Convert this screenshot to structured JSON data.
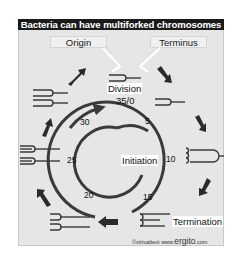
{
  "title": "Bacteria can have multiforked chromosomes",
  "callouts": {
    "origin": "Origin",
    "terminus": "Terminus"
  },
  "labels": {
    "division": "Division",
    "division_time": "35/0",
    "initiation": "Initiation",
    "termination": "Termination"
  },
  "cycle_times": {
    "inner": [
      "5",
      "10",
      "15",
      "20"
    ],
    "outer": [
      "25",
      "30"
    ]
  },
  "stages": [
    {
      "position": "top-center",
      "form": "single fork (replication initiated)"
    },
    {
      "position": "upper-right",
      "form": "single fork, extended"
    },
    {
      "position": "right",
      "form": "multiforked (secondary forks)"
    },
    {
      "position": "lower-right",
      "form": "multiforked, at termination"
    },
    {
      "position": "lower-left",
      "form": "two daughter forks"
    },
    {
      "position": "left",
      "form": "multiforked daughters"
    },
    {
      "position": "upper-left",
      "form": "two daughters with forks"
    }
  ],
  "copyright": {
    "prefix": "©virtualtext",
    "www": "www.",
    "site": "ergito",
    "tld": ".com"
  },
  "colors": {
    "title_bg": "#1a1a1a",
    "panel_bg": "#e6e6e6",
    "stroke": "#3a3a3a",
    "arrow": "#2a2a2a"
  }
}
